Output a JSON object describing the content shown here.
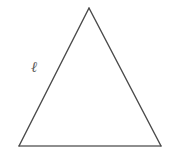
{
  "figure": {
    "kind": "geometry-diagram",
    "shape_name": "triangle",
    "background_color": "#ffffff",
    "canvas": {
      "width": 170,
      "height": 155
    },
    "stroke": {
      "side_color": "#4a4a4a",
      "base_color": "#6a6a6a",
      "width": 1.4
    },
    "vertices": [
      {
        "name": "apex",
        "x": 89,
        "y": 8
      },
      {
        "name": "bottom-left",
        "x": 19,
        "y": 146
      },
      {
        "name": "bottom-right",
        "x": 161,
        "y": 146
      }
    ],
    "edges": [
      {
        "name": "left-side",
        "from": "bottom-left",
        "to": "apex",
        "label": "ℓ"
      },
      {
        "name": "right-side",
        "from": "apex",
        "to": "bottom-right",
        "label": ""
      },
      {
        "name": "base",
        "from": "bottom-left",
        "to": "bottom-right",
        "label": ""
      }
    ],
    "labels": [
      {
        "name": "left-side-length",
        "text": "ℓ",
        "color": "#5a5a5a",
        "x": 36,
        "y": 68
      }
    ]
  }
}
